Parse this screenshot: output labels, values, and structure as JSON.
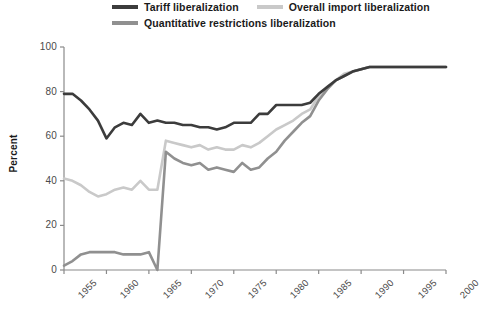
{
  "chart_data": {
    "type": "line",
    "title": "",
    "xlabel": "",
    "ylabel": "Percent",
    "xlim": [
      1955,
      2000
    ],
    "ylim": [
      0,
      100
    ],
    "grid": false,
    "legend_position": "top",
    "x_ticks": [
      "1955",
      "1960",
      "1965",
      "1970",
      "1975",
      "1980",
      "1985",
      "1990",
      "1995",
      "2000"
    ],
    "y_ticks": [
      "0",
      "20",
      "40",
      "60",
      "80",
      "100"
    ],
    "x": [
      1955,
      1956,
      1957,
      1958,
      1959,
      1960,
      1961,
      1962,
      1963,
      1964,
      1965,
      1966,
      1967,
      1968,
      1969,
      1970,
      1971,
      1972,
      1973,
      1974,
      1975,
      1976,
      1977,
      1978,
      1979,
      1980,
      1981,
      1982,
      1983,
      1984,
      1985,
      1986,
      1987,
      1988,
      1989,
      1990,
      1991,
      1992,
      1993,
      1994,
      1995,
      1996,
      1997,
      1998,
      1999,
      2000
    ],
    "series": [
      {
        "name": "Tariff liberalization",
        "color": "#3c3c3c",
        "values": [
          79,
          79,
          76,
          72,
          67,
          59,
          64,
          66,
          65,
          70,
          66,
          67,
          66,
          66,
          65,
          65,
          64,
          64,
          63,
          64,
          66,
          66,
          66,
          70,
          70,
          74,
          74,
          74,
          74,
          75,
          79,
          82,
          85,
          87,
          89,
          90,
          91,
          91,
          91,
          91,
          91,
          91,
          91,
          91,
          91,
          91
        ]
      },
      {
        "name": "Overall import liberalization",
        "color": "#c9c9c9",
        "values": [
          41,
          40,
          38,
          35,
          33,
          34,
          36,
          37,
          36,
          40,
          36,
          36,
          58,
          57,
          56,
          55,
          56,
          54,
          55,
          54,
          54,
          56,
          55,
          57,
          60,
          63,
          65,
          67,
          70,
          72,
          78,
          82,
          85,
          88,
          89,
          90,
          91,
          91,
          91,
          91,
          91,
          91,
          91,
          91,
          91,
          91
        ]
      },
      {
        "name": "Quantitative restrictions liberalization",
        "color": "#909090",
        "values": [
          2,
          4,
          7,
          8,
          8,
          8,
          8,
          7,
          7,
          7,
          8,
          0,
          53,
          50,
          48,
          47,
          48,
          45,
          46,
          45,
          44,
          48,
          45,
          46,
          50,
          53,
          58,
          62,
          66,
          69,
          76,
          81,
          85,
          87,
          89,
          90,
          91,
          91,
          91,
          91,
          91,
          91,
          91,
          91,
          91,
          91
        ]
      }
    ]
  }
}
